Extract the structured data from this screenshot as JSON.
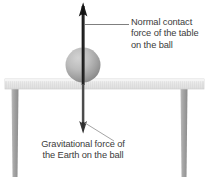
{
  "figure": {
    "background_color": "#ffffff"
  },
  "annotations": {
    "normal_force": {
      "name": "normal-contact-force",
      "line1": "Normal contact",
      "line2": "force of the table",
      "line3": "on the ball",
      "text_color": "#3b3b3b",
      "leader": "horizontal line from arrow shaft to text"
    },
    "gravitational_force": {
      "name": "gravitational-force",
      "line1": "Gravitational force of",
      "line2": "the Earth on the ball",
      "text_color": "#3b3b3b",
      "leader": "diagonal line from arrow head to text"
    }
  },
  "objects": {
    "ball": {
      "name": "ball",
      "shading": "radial gradient grey sphere",
      "color_light": "#c9c9c9",
      "color_dark": "#808080",
      "center_x": 83,
      "center_y": 65,
      "radius": 17
    },
    "table": {
      "name": "table",
      "top_color": "#e8e8e8",
      "leg_color": "#9a9a9a",
      "top_x": 5,
      "top_y": 79,
      "top_width": 199,
      "top_height": 10,
      "leg_left_x": 11,
      "leg_right_x": 180,
      "leg_bottom_y": 177
    },
    "arrow_up": {
      "name": "normal-force-arrow",
      "color": "#1a1a1a",
      "from_y": 133,
      "to_y": 3,
      "x": 83,
      "direction": "up"
    },
    "arrow_down": {
      "name": "gravity-force-arrow",
      "color": "#3a3a3a",
      "from_y": 60,
      "to_y": 133,
      "x": 83,
      "direction": "down"
    }
  },
  "colors": {
    "text": "#3b3b3b",
    "arrow": "#1a1a1a",
    "table_top": "#e8e8e8",
    "table_leg": "#9a9a9a",
    "ball_highlight": "#cfcfcf",
    "ball_shadow": "#7a7a7a"
  }
}
